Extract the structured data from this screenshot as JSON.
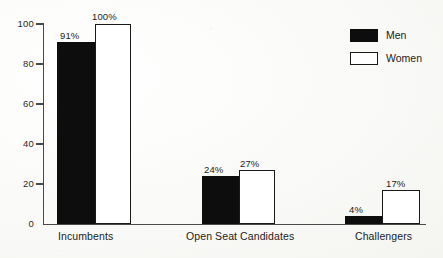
{
  "chart_data": {
    "type": "bar",
    "title": "",
    "subtitle": "",
    "xlabel": "",
    "ylabel": "",
    "ylim": [
      0,
      100
    ],
    "yticks": [
      0,
      20,
      40,
      60,
      80,
      100
    ],
    "ytick_labels": [
      "0",
      "20",
      "40",
      "60",
      "80",
      "100"
    ],
    "grid": false,
    "legend_position": "top-right",
    "categories": [
      "Incumbents",
      "Open Seat Candidates",
      "Challengers"
    ],
    "series": [
      {
        "name": "Men",
        "color": "#0d0d0d",
        "values": [
          91,
          24,
          4
        ],
        "labels": [
          "91%",
          "24%",
          "4%"
        ]
      },
      {
        "name": "Women",
        "color": "#ffffff",
        "border_color": "#1a1a1a",
        "values": [
          100,
          27,
          17
        ],
        "labels": [
          "100%",
          "27%",
          "17%"
        ]
      }
    ]
  },
  "legend": {
    "items": [
      {
        "label": "Men",
        "swatch": "filled-black-square"
      },
      {
        "label": "Women",
        "swatch": "outlined-white-square"
      }
    ]
  },
  "axis": {
    "y_ticks": [
      {
        "value": 100,
        "label": "100"
      },
      {
        "value": 80,
        "label": "80"
      },
      {
        "value": 60,
        "label": "60"
      },
      {
        "value": 40,
        "label": "40"
      },
      {
        "value": 20,
        "label": "20"
      },
      {
        "value": 0,
        "label": "0"
      }
    ]
  },
  "colors": {
    "men": "#0d0d0d",
    "women": "#ffffff",
    "outline": "#1a1a1a",
    "axis": "#4a4a4a",
    "background": "#fbfbf9",
    "text": "#1c1c1c"
  }
}
